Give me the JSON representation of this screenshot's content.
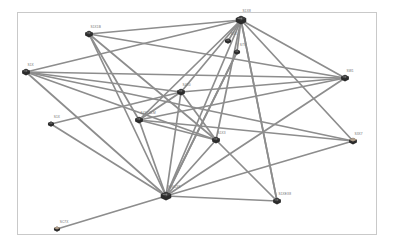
{
  "app": {
    "title": "Network Topology Map",
    "canvas_background": "#ffffff",
    "frame_border_color": "#c9c9c9"
  },
  "style": {
    "edge_color": "#8d8d8d",
    "node_color": "#2b2b2b",
    "node_accent_color": "#b5a088",
    "label_color": "#6e6e6e"
  },
  "graph": {
    "node_count": 14,
    "edge_count": 39,
    "nodes": [
      {
        "id": "n1",
        "label": "S1X8",
        "x": 241,
        "y": 20,
        "size": "hub",
        "accent": false
      },
      {
        "id": "n2",
        "label": "S1X1B",
        "x": 89,
        "y": 34,
        "size": "normal",
        "accent": false
      },
      {
        "id": "n3",
        "label": "S7X",
        "x": 237,
        "y": 52,
        "size": "small",
        "accent": false
      },
      {
        "id": "n4",
        "label": "S1X",
        "x": 26,
        "y": 72,
        "size": "normal",
        "accent": false
      },
      {
        "id": "n5",
        "label": "SW1",
        "x": 345,
        "y": 78,
        "size": "normal",
        "accent": false
      },
      {
        "id": "n6",
        "label": "S4X0",
        "x": 181,
        "y": 92,
        "size": "normal",
        "accent": false
      },
      {
        "id": "n7",
        "label": "S4XC0LM",
        "x": 139,
        "y": 120,
        "size": "normal",
        "accent": false
      },
      {
        "id": "n8",
        "label": "S1X",
        "x": 51,
        "y": 124,
        "size": "small",
        "accent": false
      },
      {
        "id": "n9",
        "label": "S1X3",
        "x": 216,
        "y": 140,
        "size": "normal",
        "accent": false
      },
      {
        "id": "n10",
        "label": "S3X7",
        "x": 353,
        "y": 141,
        "size": "normal",
        "accent": true
      },
      {
        "id": "n11",
        "label": "S1XCX8",
        "x": 166,
        "y": 196,
        "size": "hub",
        "accent": false
      },
      {
        "id": "n12",
        "label": "S1XEX8",
        "x": 277,
        "y": 201,
        "size": "normal",
        "accent": false
      },
      {
        "id": "n13",
        "label": "SC7X",
        "x": 57,
        "y": 229,
        "size": "small",
        "accent": true
      },
      {
        "id": "n14",
        "label": "S1X",
        "x": 228,
        "y": 41,
        "size": "small",
        "accent": false
      }
    ],
    "edges": [
      {
        "from": "n1",
        "to": "n2"
      },
      {
        "from": "n1",
        "to": "n4"
      },
      {
        "from": "n1",
        "to": "n5"
      },
      {
        "from": "n1",
        "to": "n3"
      },
      {
        "from": "n1",
        "to": "n14"
      },
      {
        "from": "n1",
        "to": "n6"
      },
      {
        "from": "n1",
        "to": "n7"
      },
      {
        "from": "n1",
        "to": "n9"
      },
      {
        "from": "n1",
        "to": "n10"
      },
      {
        "from": "n1",
        "to": "n11"
      },
      {
        "from": "n1",
        "to": "n12"
      },
      {
        "from": "n2",
        "to": "n5"
      },
      {
        "from": "n2",
        "to": "n9"
      },
      {
        "from": "n2",
        "to": "n11"
      },
      {
        "from": "n2",
        "to": "n7"
      },
      {
        "from": "n4",
        "to": "n5"
      },
      {
        "from": "n4",
        "to": "n6"
      },
      {
        "from": "n4",
        "to": "n9"
      },
      {
        "from": "n4",
        "to": "n11"
      },
      {
        "from": "n4",
        "to": "n10"
      },
      {
        "from": "n5",
        "to": "n7"
      },
      {
        "from": "n5",
        "to": "n11"
      },
      {
        "from": "n5",
        "to": "n6"
      },
      {
        "from": "n6",
        "to": "n7"
      },
      {
        "from": "n6",
        "to": "n11"
      },
      {
        "from": "n6",
        "to": "n9"
      },
      {
        "from": "n7",
        "to": "n11"
      },
      {
        "from": "n7",
        "to": "n9"
      },
      {
        "from": "n7",
        "to": "n10"
      },
      {
        "from": "n8",
        "to": "n11"
      },
      {
        "from": "n8",
        "to": "n6"
      },
      {
        "from": "n9",
        "to": "n11"
      },
      {
        "from": "n9",
        "to": "n12"
      },
      {
        "from": "n10",
        "to": "n11"
      },
      {
        "from": "n11",
        "to": "n12"
      },
      {
        "from": "n11",
        "to": "n13"
      },
      {
        "from": "n11",
        "to": "n3"
      },
      {
        "from": "n3",
        "to": "n11"
      },
      {
        "from": "n12",
        "to": "n1"
      }
    ]
  }
}
